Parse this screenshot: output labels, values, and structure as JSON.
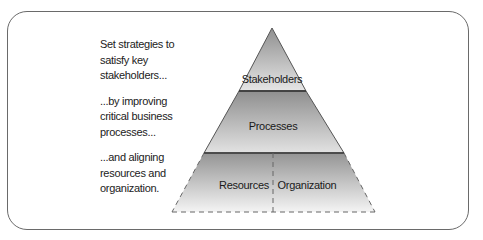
{
  "narrative": {
    "paragraphs": [
      [
        "Set strategies to",
        "satisfy key",
        "stakeholders..."
      ],
      [
        "...by improving",
        "critical business",
        "processes..."
      ],
      [
        "...and aligning",
        "resources and",
        "organization."
      ]
    ]
  },
  "pyramid": {
    "tiers": [
      {
        "label": "Stakeholders",
        "level": "top"
      },
      {
        "label": "Processes",
        "level": "middle"
      },
      {
        "label": "Resources",
        "level": "bottom-left"
      },
      {
        "label": "Organization",
        "level": "bottom-right"
      }
    ],
    "colors": {
      "gradient_dark": "#8f8f8f",
      "gradient_light": "#ececec",
      "outline": "#555555",
      "divider": "#333333"
    }
  }
}
